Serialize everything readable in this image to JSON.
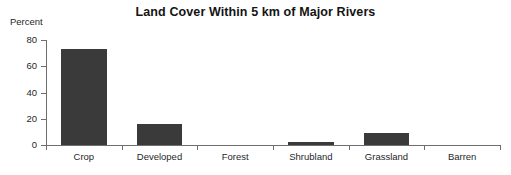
{
  "chart_data": {
    "type": "bar",
    "title": "Land Cover Within 5 km of Major Rivers",
    "xlabel": "",
    "ylabel": "Percent",
    "categories": [
      "Crop",
      "Developed",
      "Forest",
      "Shrubland",
      "Grassland",
      "Barren"
    ],
    "values": [
      73,
      16,
      0,
      2,
      9,
      0
    ],
    "yticks": [
      0,
      20,
      40,
      60,
      80
    ],
    "ylim": [
      0,
      80
    ],
    "grid": false,
    "legend": false,
    "bar_color": "#3a3a3a",
    "axis_color": "#6e6e6e",
    "text_color": "#1f1f1f"
  },
  "axis": {
    "y_caption": "Percent",
    "tick_labels": [
      "0",
      "20",
      "40",
      "60",
      "80"
    ]
  }
}
